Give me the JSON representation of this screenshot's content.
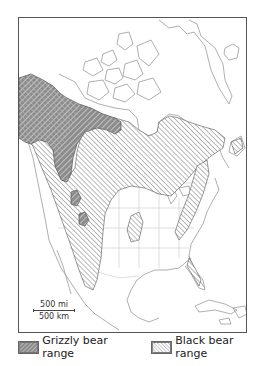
{
  "map": {
    "title": "Grizzly and black bear ranges in North America",
    "scale": {
      "miles_label": "500 mi",
      "km_label": "500 km"
    },
    "colors": {
      "frame": "#555555",
      "coastline": "#9a9a9a",
      "state_border": "#c8c8c8",
      "grizzly_fill": "#8c8c8c",
      "grizzly_hatch": "#d9d9d9",
      "black_fill": "#ffffff",
      "black_hatch": "#8a8a8a",
      "outline": "#555555"
    }
  },
  "legend": {
    "items": [
      {
        "label": "Grizzly bear range",
        "pattern": "grizzly-hatch"
      },
      {
        "label": "Black bear range",
        "pattern": "black-hatch"
      }
    ]
  }
}
